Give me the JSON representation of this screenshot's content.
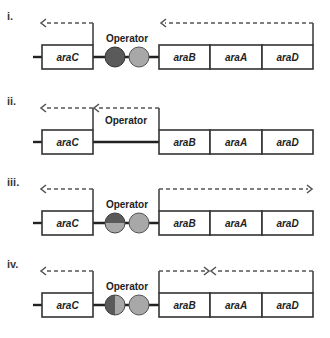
{
  "figure": {
    "colors": {
      "dark_protein": "#5a5a5a",
      "light_protein": "#a8a8a8",
      "box_stroke": "#333333",
      "dashed_transcript": "#555555"
    },
    "genes": [
      "araC",
      "araB",
      "araA",
      "araD"
    ],
    "operator_label": "Operator",
    "panels": [
      {
        "label": "i.",
        "operator_state": "two-circles-dark-left-light-right",
        "left_circle": "dark",
        "right_circle": "light",
        "araC_transcript": "leftward",
        "araBAD_transcript": "leftward-from-right"
      },
      {
        "label": "ii.",
        "operator_state": "no-proteins-bound",
        "left_circle": "none",
        "right_circle": "none",
        "araC_transcript": "leftward",
        "araBAD_transcript": "leftward-from-right-into-araC"
      },
      {
        "label": "iii.",
        "operator_state": "two-circles-left-split-horizontal",
        "left_circle": "split-top-dark-bottom-light",
        "right_circle": "light",
        "araC_transcript": "leftward",
        "araBAD_transcript": "rightward"
      },
      {
        "label": "iv.",
        "operator_state": "two-circles-left-split-vertical",
        "left_circle": "split-left-dark-right-light",
        "right_circle": "light",
        "araC_transcript": "leftward",
        "araBAD_transcript": "converging"
      }
    ]
  }
}
